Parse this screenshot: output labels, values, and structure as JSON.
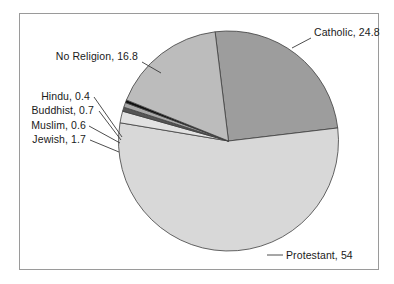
{
  "chart_data": {
    "type": "pie",
    "title": "",
    "xlabel": "",
    "ylabel": "",
    "legend_position": "none",
    "grid": false,
    "label_format": "{name}, {value}",
    "start_angle_deg": -7,
    "direction": "clockwise",
    "categories": [
      "Catholic",
      "Protestant",
      "Jewish",
      "Muslim",
      "Buddhist",
      "Hindu",
      "No Religion"
    ],
    "values": [
      24.8,
      54,
      1.7,
      0.6,
      0.7,
      0.4,
      16.8
    ],
    "slices": [
      {
        "name": "Catholic",
        "value": 24.8,
        "label": "Catholic, 24.8",
        "color": "#9d9d9d"
      },
      {
        "name": "Protestant",
        "value": 54,
        "label": "Protestant, 54",
        "color": "#d8d8d8"
      },
      {
        "name": "Jewish",
        "value": 1.7,
        "label": "Jewish, 1.7",
        "color": "#e2e2e2"
      },
      {
        "name": "Muslim",
        "value": 0.6,
        "label": "Muslim, 0.6",
        "color": "#555555"
      },
      {
        "name": "Buddhist",
        "value": 0.7,
        "label": "Buddhist, 0.7",
        "color": "#a8a8a8"
      },
      {
        "name": "Hindu",
        "value": 0.4,
        "label": "Hindu, 0.4",
        "color": "#0d0d0d"
      },
      {
        "name": "No Religion",
        "value": 16.8,
        "label": "No Religion, 16.8",
        "color": "#bcbcbc"
      }
    ]
  },
  "frame": {
    "border_color": "#9a9a9a",
    "background": "#ffffff"
  },
  "labels": {
    "catholic": "Catholic, 24.8",
    "protestant": "Protestant, 54",
    "no_religion": "No Religion, 16.8",
    "hindu": "Hindu, 0.4",
    "buddhist": "Buddhist, 0.7",
    "muslim": "Muslim, 0.6",
    "jewish": "Jewish, 1.7"
  }
}
